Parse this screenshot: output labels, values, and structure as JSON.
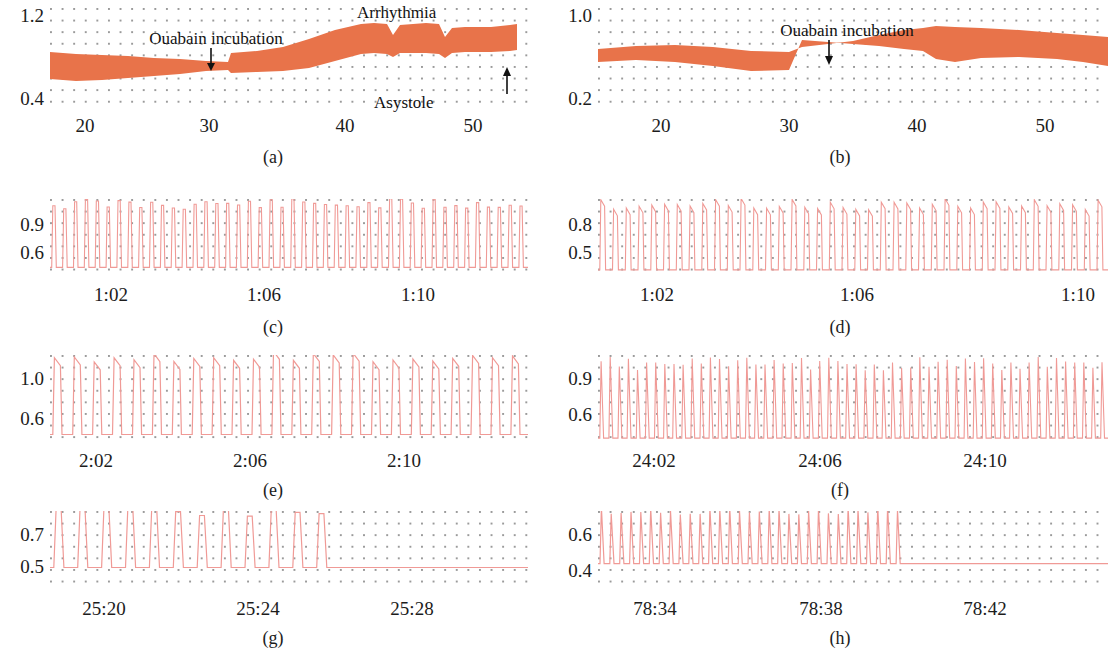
{
  "figure": {
    "caption_style": "lettered-subpanels",
    "panel_count": 8,
    "trace_color_envelope": "#e8734a",
    "trace_color_waveform": "#f09a96",
    "grid_dot_color": "#9a9a9a",
    "background": "#ffffff"
  },
  "panels": [
    {
      "id": "a",
      "label": "(a)",
      "yticks": [
        "1.2",
        "0.4"
      ],
      "xticks": [
        "20",
        "30",
        "40",
        "50"
      ],
      "annotations": [
        {
          "name": "ouabain-incubation",
          "text": "Ouabain incubation",
          "arrow": "down"
        },
        {
          "name": "arrhythmia",
          "text": "Arrhythmia",
          "arrow": "none"
        },
        {
          "name": "asystole",
          "text": "Asystole",
          "arrow": "up"
        }
      ]
    },
    {
      "id": "b",
      "label": "(b)",
      "yticks": [
        "1.0",
        "0.2"
      ],
      "xticks": [
        "20",
        "30",
        "40",
        "50"
      ],
      "annotations": [
        {
          "name": "ouabain-incubation",
          "text": "Ouabain incubation",
          "arrow": "down"
        }
      ]
    },
    {
      "id": "c",
      "label": "(c)",
      "yticks": [
        "0.9",
        "0.6"
      ],
      "xticks": [
        "1:02",
        "1:06",
        "1:10"
      ],
      "annotations": []
    },
    {
      "id": "d",
      "label": "(d)",
      "yticks": [
        "0.8",
        "0.5"
      ],
      "xticks": [
        "1:02",
        "1:06",
        "1:10"
      ],
      "annotations": []
    },
    {
      "id": "e",
      "label": "(e)",
      "yticks": [
        "1.0",
        "0.6"
      ],
      "xticks": [
        "2:02",
        "2:06",
        "2:10"
      ],
      "annotations": []
    },
    {
      "id": "f",
      "label": "(f)",
      "yticks": [
        "0.9",
        "0.6"
      ],
      "xticks": [
        "24:02",
        "24:06",
        "24:10"
      ],
      "annotations": []
    },
    {
      "id": "g",
      "label": "(g)",
      "yticks": [
        "0.7",
        "0.5"
      ],
      "xticks": [
        "25:20",
        "25:24",
        "25:28"
      ],
      "annotations": []
    },
    {
      "id": "h",
      "label": "(h)",
      "yticks": [
        "0.6",
        "0.4"
      ],
      "xticks": [
        "78:34",
        "78:38",
        "78:42"
      ],
      "annotations": []
    }
  ],
  "chart_data": [
    {
      "type": "area",
      "panel": "a",
      "title": "",
      "xlabel": "",
      "ylabel": "",
      "ylim": [
        0.4,
        1.2
      ],
      "xlim": [
        16,
        53
      ],
      "yticks": [
        0.4,
        1.2
      ],
      "xticks": [
        20,
        30,
        40,
        50
      ],
      "grid": "dotted",
      "legend": "none",
      "description": "Contraction amplitude envelope band; baseline until ouabain at t=30, rising amplitude, arrhythmic irregularity after t=42, terminating in asystole at t=52",
      "series": [
        {
          "name": "envelope-upper",
          "x": [
            16,
            18,
            20,
            22,
            24,
            26,
            28,
            29.8,
            30.2,
            32,
            34,
            36,
            38,
            40,
            41,
            42,
            42.5,
            43,
            44,
            45,
            46,
            46.5,
            47,
            48,
            50,
            51.5,
            52
          ],
          "values": [
            0.76,
            0.75,
            0.75,
            0.74,
            0.73,
            0.73,
            0.72,
            0.72,
            0.8,
            0.82,
            0.86,
            0.93,
            1.01,
            1.06,
            1.07,
            1.06,
            0.97,
            1.05,
            1.06,
            1.07,
            1.06,
            0.95,
            1.02,
            1.03,
            1.03,
            1.05,
            1.06
          ]
        },
        {
          "name": "envelope-lower",
          "x": [
            16,
            18,
            20,
            22,
            24,
            26,
            28,
            29.8,
            30.2,
            32,
            34,
            36,
            38,
            40,
            41,
            42,
            42.5,
            43,
            44,
            45,
            46,
            46.5,
            47,
            48,
            50,
            51.5,
            52
          ],
          "values": [
            0.66,
            0.64,
            0.63,
            0.62,
            0.6,
            0.58,
            0.56,
            0.55,
            0.58,
            0.57,
            0.57,
            0.6,
            0.67,
            0.73,
            0.74,
            0.73,
            0.7,
            0.72,
            0.73,
            0.73,
            0.72,
            0.68,
            0.71,
            0.71,
            0.71,
            0.73,
            0.74
          ]
        }
      ],
      "events": [
        {
          "label": "Ouabain incubation",
          "x": 30
        },
        {
          "label": "Arrhythmia",
          "x": 43
        },
        {
          "label": "Asystole",
          "x": 52
        }
      ]
    },
    {
      "type": "area",
      "panel": "b",
      "ylim": [
        0.2,
        1.0
      ],
      "xlim": [
        15,
        55
      ],
      "yticks": [
        0.2,
        1.0
      ],
      "xticks": [
        20,
        30,
        40,
        50
      ],
      "grid": "dotted",
      "legend": "none",
      "description": "Contraction amplitude envelope band; gradual rise after ouabain at t=30, peak near t=41, slow decline",
      "series": [
        {
          "name": "envelope-upper",
          "x": [
            15,
            18,
            21,
            24,
            27,
            30,
            31,
            33,
            35,
            37,
            39,
            40.5,
            41.5,
            43,
            45,
            48,
            51,
            53,
            55
          ],
          "values": [
            0.66,
            0.68,
            0.69,
            0.67,
            0.65,
            0.64,
            0.68,
            0.7,
            0.73,
            0.78,
            0.82,
            0.84,
            0.86,
            0.85,
            0.84,
            0.82,
            0.8,
            0.78,
            0.76
          ]
        },
        {
          "name": "envelope-lower",
          "x": [
            15,
            18,
            21,
            24,
            27,
            30,
            31,
            33,
            35,
            37,
            39,
            40.5,
            41.5,
            43,
            45,
            48,
            51,
            53,
            55
          ],
          "values": [
            0.56,
            0.58,
            0.59,
            0.55,
            0.51,
            0.5,
            0.53,
            0.54,
            0.56,
            0.6,
            0.65,
            0.67,
            0.62,
            0.61,
            0.62,
            0.61,
            0.59,
            0.56,
            0.53
          ]
        }
      ],
      "events": [
        {
          "label": "Ouabain incubation",
          "x": 30
        }
      ]
    },
    {
      "type": "line",
      "panel": "c",
      "ylim": [
        0.6,
        0.9
      ],
      "yticks": [
        0.6,
        0.9
      ],
      "xticks": [
        "1:02",
        "1:06",
        "1:10"
      ],
      "grid": "dotted",
      "legend": "none",
      "description": "Expanded trace: regular high-frequency contractions, approximately 44 beats across window, peak ~0.88 baseline ~0.63",
      "beat_count": 44,
      "peak_value": 0.88,
      "baseline_value": 0.63,
      "flatline_from_fraction": null
    },
    {
      "type": "line",
      "panel": "d",
      "ylim": [
        0.5,
        0.8
      ],
      "yticks": [
        0.5,
        0.8
      ],
      "xticks": [
        "1:02",
        "1:06",
        "1:10"
      ],
      "grid": "dotted",
      "legend": "none",
      "description": "Expanded trace: regular contractions with square-ish plateaus, approximately 40 beats, peak ~0.78 baseline ~0.52",
      "beat_count": 40,
      "peak_value": 0.78,
      "baseline_value": 0.52,
      "flatline_from_fraction": null
    },
    {
      "type": "line",
      "panel": "e",
      "ylim": [
        0.6,
        1.0
      ],
      "yticks": [
        0.6,
        1.0
      ],
      "xticks": [
        "2:02",
        "2:06",
        "2:10"
      ],
      "grid": "dotted",
      "legend": "none",
      "description": "Expanded trace: lower-frequency larger-amplitude contractions, approximately 24 beats, peak ~1.0 baseline ~0.63",
      "beat_count": 24,
      "peak_value": 1.0,
      "baseline_value": 0.63,
      "flatline_from_fraction": null
    },
    {
      "type": "line",
      "panel": "f",
      "ylim": [
        0.6,
        0.9
      ],
      "yticks": [
        0.6,
        0.9
      ],
      "xticks": [
        "24:02",
        "24:06",
        "24:10"
      ],
      "grid": "dotted",
      "legend": "none",
      "description": "Expanded trace: rapid narrow triangular spikes, approximately 56 beats, peak ~0.87 baseline ~0.61",
      "beat_count": 56,
      "peak_value": 0.87,
      "baseline_value": 0.61,
      "flatline_from_fraction": null
    },
    {
      "type": "line",
      "panel": "g",
      "ylim": [
        0.5,
        0.7
      ],
      "yticks": [
        0.5,
        0.7
      ],
      "xticks": [
        "25:20",
        "25:24",
        "25:28"
      ],
      "grid": "dotted",
      "legend": "none",
      "description": "Expanded trace: sparse irregular contractions ceasing at about 60 percent of the window, then flat asystolic line",
      "beat_count": 12,
      "peak_value": 0.7,
      "baseline_value": 0.555,
      "flatline_from_fraction": 0.6
    },
    {
      "type": "line",
      "panel": "h",
      "ylim": [
        0.4,
        0.6
      ],
      "yticks": [
        0.4,
        0.6
      ],
      "xticks": [
        "78:34",
        "78:38",
        "78:42"
      ],
      "grid": "dotted",
      "legend": "none",
      "description": "Expanded trace: regular contractions abruptly stopping at about 60 percent of the window, then flat asystolic line",
      "beat_count": 31,
      "peak_value": 0.6,
      "baseline_value": 0.465,
      "flatline_from_fraction": 0.6
    }
  ]
}
